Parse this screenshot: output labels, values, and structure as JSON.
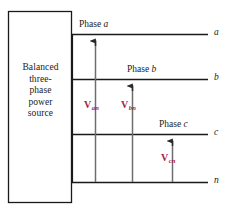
{
  "figure": {
    "type": "circuit-diagram",
    "background_color": "#ffffff",
    "line_color": "#1a1a1a",
    "voltage_label_color": "#a51c3e"
  },
  "source_box": {
    "name": "balanced-three-phase-source",
    "lines": [
      "Balanced",
      "three-",
      "phase",
      "power",
      "source"
    ],
    "x": 8,
    "y": 11,
    "width": 64,
    "height": 192
  },
  "phase_labels": [
    {
      "id": "phase-a",
      "prefix": "Phase",
      "symbol": "a",
      "x": 79,
      "y": 19
    },
    {
      "id": "phase-b",
      "prefix": "Phase",
      "symbol": "b",
      "x": 127,
      "y": 64
    },
    {
      "id": "phase-c",
      "prefix": "Phase",
      "symbol": "c",
      "x": 159,
      "y": 119
    }
  ],
  "terminals": [
    {
      "id": "terminal-a",
      "label": "a",
      "x": 214,
      "y": 28,
      "line_y": 34
    },
    {
      "id": "terminal-b",
      "label": "b",
      "x": 214,
      "y": 73,
      "line_y": 79
    },
    {
      "id": "terminal-c",
      "label": "c",
      "x": 214,
      "y": 128,
      "line_y": 134
    },
    {
      "id": "terminal-n",
      "label": "n",
      "x": 214,
      "y": 176,
      "line_y": 182
    }
  ],
  "conductors": [
    {
      "id": "conductor-a",
      "from_x": 72,
      "to_x": 208,
      "y": 34
    },
    {
      "id": "conductor-b",
      "from_x": 72,
      "to_x": 208,
      "y": 79
    },
    {
      "id": "conductor-c",
      "from_x": 72,
      "to_x": 208,
      "y": 134
    },
    {
      "id": "conductor-n",
      "from_x": 72,
      "to_x": 208,
      "y": 182
    }
  ],
  "voltage_arrows": [
    {
      "id": "voltage-an",
      "symbol": "V",
      "subscript": "an",
      "x": 95,
      "tail_y": 182,
      "head_y": 34,
      "label_x": 84,
      "label_y": 99
    },
    {
      "id": "voltage-bn",
      "symbol": "V",
      "subscript": "bn",
      "x": 132,
      "tail_y": 182,
      "head_y": 79,
      "label_x": 121,
      "label_y": 99
    },
    {
      "id": "voltage-cn",
      "symbol": "V",
      "subscript": "cn",
      "x": 172,
      "tail_y": 182,
      "head_y": 134,
      "label_x": 161,
      "label_y": 152
    }
  ]
}
